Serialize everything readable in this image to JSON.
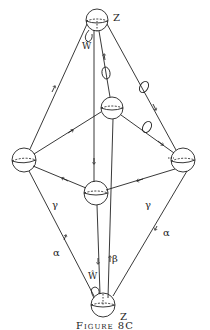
{
  "figure": {
    "caption": "Figure 8C"
  },
  "labels": {
    "z_top": "Z",
    "w_hat_top": "Ŵ",
    "gamma_left": "γ",
    "gamma_right": "γ",
    "alpha_left": "α",
    "alpha_right": "α",
    "beta": "β",
    "w_hat_bottom": "Ŵ",
    "z_bottom": "Z"
  },
  "nodes": [
    {
      "id": "top",
      "label": "Z",
      "cx": 97,
      "cy": 20,
      "r": 11
    },
    {
      "id": "upper-middle",
      "cx": 112,
      "cy": 108,
      "r": 11
    },
    {
      "id": "left",
      "cx": 24,
      "cy": 160,
      "r": 12
    },
    {
      "id": "right",
      "cx": 183,
      "cy": 160,
      "r": 12
    },
    {
      "id": "lower-middle",
      "cx": 96,
      "cy": 193,
      "r": 12
    },
    {
      "id": "bottom",
      "label": "Z",
      "cx": 103,
      "cy": 305,
      "r": 12
    }
  ],
  "colors": {
    "stroke": "#222222",
    "background": "#ffffff"
  }
}
